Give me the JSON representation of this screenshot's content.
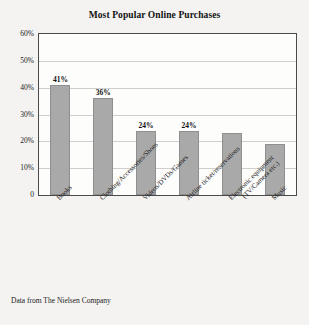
{
  "chart_data": {
    "type": "bar",
    "title": "Most Popular Online Purchases",
    "xlabel": "",
    "ylabel": "",
    "ylim": [
      0,
      60
    ],
    "grid": true,
    "legend": null,
    "categories": [
      "Books",
      "Clothing/Accessories/Shoes",
      "Videos/DVDs/Games",
      "Airline ticket/reservations",
      "Electronic equipment (TV/Camera etc.)",
      "Music"
    ],
    "category_lines": [
      [
        "Books"
      ],
      [
        "Clothing/Accessories/Shoes"
      ],
      [
        "Videos/DVDs/Games"
      ],
      [
        "Airline ticket/reservations"
      ],
      [
        "Electronic equipment",
        "(TV/Camera etc.)"
      ],
      [
        "Music"
      ]
    ],
    "values": [
      41,
      36,
      24,
      24,
      23,
      19
    ],
    "data_labels": [
      "41%",
      "36%",
      "24%",
      "24%",
      "",
      ""
    ],
    "ytick_values": [
      60,
      50,
      40,
      30,
      20,
      10,
      0
    ],
    "ytick_labels": [
      "60%",
      "50%",
      "40%",
      "30%",
      "20%",
      "10%",
      "0"
    ],
    "bar_color": "#a9a9a9",
    "bar_edge_color": "#8f8f8f",
    "grid_color": "#cfcfcf",
    "frame_color": "#4a4a4a"
  },
  "caption": {
    "source_note": "Data from The Nielsen Company"
  }
}
